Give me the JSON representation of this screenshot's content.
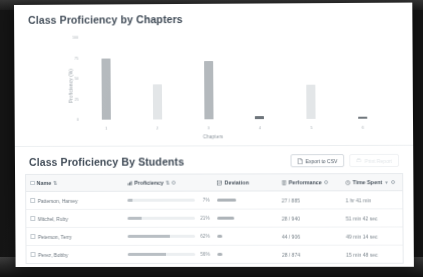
{
  "chart_card": {
    "title": "Class Proficiency by Chapters"
  },
  "students_card": {
    "title": "Class Proficiency By Students",
    "export_button": "Export to CSV",
    "secondary_button": "Print Report"
  },
  "table": {
    "columns": [
      {
        "key": "name",
        "label": "Name",
        "sortable": true,
        "info": false
      },
      {
        "key": "proficiency",
        "label": "Proficiency",
        "sortable": true,
        "info": true
      },
      {
        "key": "deviation",
        "label": "Deviation",
        "sortable": false,
        "info": false
      },
      {
        "key": "performance",
        "label": "Performance",
        "sortable": false,
        "info": true
      },
      {
        "key": "time_spent",
        "label": "Time Spent",
        "sortable": true,
        "info": true
      }
    ],
    "rows": [
      {
        "name": "Patterson, Harvey",
        "proficiency_pct": 7,
        "proficiency_label": "7%",
        "deviation_pct": 34,
        "performance": "27 / 885",
        "time_spent": "1 hr 41 min"
      },
      {
        "name": "Mitchel, Ruby",
        "proficiency_pct": 21,
        "proficiency_label": "21%",
        "deviation_pct": 30,
        "performance": "28 / 940",
        "time_spent": "51 min 42 sec"
      },
      {
        "name": "Peterson, Terry",
        "proficiency_pct": 62,
        "proficiency_label": "62%",
        "deviation_pct": 9,
        "performance": "44 / 906",
        "time_spent": "49 min 14 sec"
      },
      {
        "name": "Perez, Bobby",
        "proficiency_pct": 56,
        "proficiency_label": "56%",
        "deviation_pct": 8,
        "performance": "28 / 874",
        "time_spent": "15 min 48 sec"
      }
    ]
  },
  "chart_data": {
    "type": "bar",
    "title": "Class Proficiency by Chapters",
    "xlabel": "Chapters",
    "ylabel": "Proficiency (%)",
    "categories": [
      "1",
      "2",
      "3",
      "4",
      "5",
      "6"
    ],
    "values": [
      74,
      43,
      71,
      4,
      41,
      3
    ],
    "bar_colors": [
      "#b4b9bd",
      "#e3e6e8",
      "#b4b9bd",
      "#6f767c",
      "#e3e6e8",
      "#6f767c"
    ],
    "ylim": [
      0,
      100
    ],
    "yticks": [
      0,
      25,
      50,
      75,
      100
    ],
    "ytick_labels": [
      "0",
      "25",
      "50",
      "75",
      "100"
    ],
    "grid": false,
    "legend": false
  },
  "colors": {
    "card_bg": "#ffffff",
    "title_text": "#3f4a56",
    "muted_text": "#8b949c",
    "border": "#e7eaed",
    "header_bg": "#f7f8f9",
    "bar_light": "#e3e6e8",
    "bar_mid": "#b4b9bd",
    "bar_dark": "#6f767c"
  }
}
